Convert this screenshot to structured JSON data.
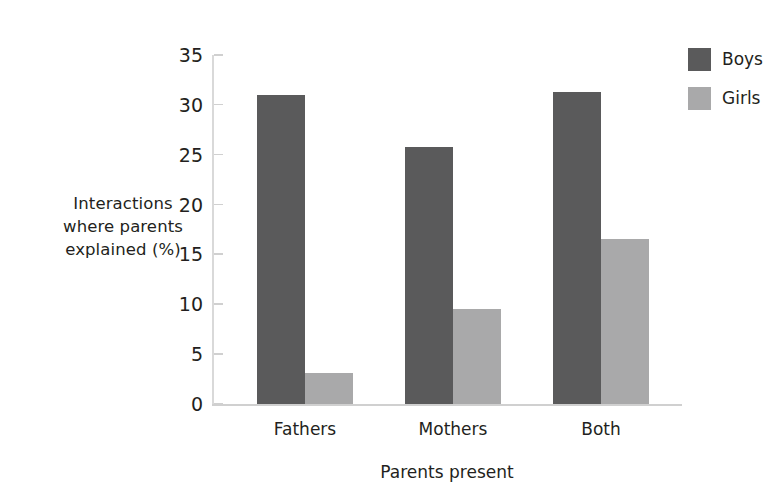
{
  "chart_data": {
    "type": "bar",
    "title": "",
    "subtitle": "",
    "xlabel": "Parents present",
    "ylabel": "Interactions where parents explained (%)",
    "ylabel_lines": [
      "Interactions",
      "where parents",
      "explained (%)"
    ],
    "categories": [
      "Fathers",
      "Mothers",
      "Both"
    ],
    "series": [
      {
        "name": "Boys",
        "color": "#5a5a5b",
        "values": [
          31.0,
          25.8,
          31.3
        ]
      },
      {
        "name": "Girls",
        "color": "#a9a9aa",
        "values": [
          3.1,
          9.5,
          16.5
        ]
      }
    ],
    "ylim": [
      0,
      35
    ],
    "yticks": [
      0,
      5,
      10,
      15,
      20,
      25,
      30,
      35
    ],
    "ytick_labels": [
      "0",
      "5",
      "10",
      "15",
      "20",
      "25",
      "30",
      "35"
    ],
    "grid": false,
    "legend_position": "top-right",
    "legend_entries": [
      "Boys",
      "Girls"
    ],
    "axis_color": "#d0d0d0",
    "background": "#ffffff"
  }
}
